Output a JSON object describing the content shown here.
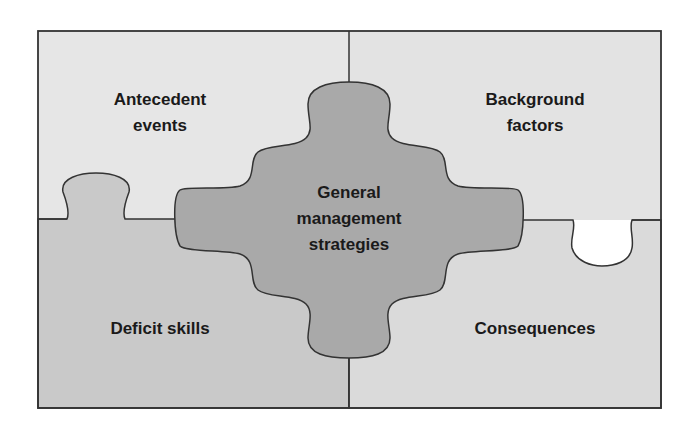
{
  "diagram": {
    "type": "jigsaw-puzzle",
    "pieces": {
      "top_left": {
        "label": "Antecedent\nevents",
        "fill": "#e6e6e6"
      },
      "top_right": {
        "label": "Background\nfactors",
        "fill": "#e3e3e3"
      },
      "bottom_left": {
        "label": "Deficit skills",
        "fill": "#c9c9c9"
      },
      "bottom_right": {
        "label": "Consequences",
        "fill": "#dadada"
      },
      "center": {
        "label": "General\nmanagement\nstrategies",
        "fill": "#a9a9a9"
      }
    },
    "stroke": "#333333"
  }
}
